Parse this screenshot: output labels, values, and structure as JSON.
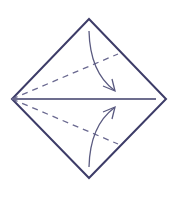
{
  "diagram": {
    "type": "origami-fold-instruction",
    "colors": {
      "line": "#3d3c68",
      "dashed": "#6a6990",
      "arrow": "#5a5a80",
      "background": "#ffffff"
    },
    "shape": {
      "top": [
        89,
        19
      ],
      "right": [
        166,
        99
      ],
      "bottom": [
        89,
        178
      ],
      "left": [
        12,
        99
      ]
    },
    "center_crease": {
      "from": [
        12,
        99
      ],
      "to": [
        156,
        99
      ]
    },
    "dashed_folds": [
      {
        "from": [
          12,
          99
        ],
        "to": [
          118,
          54
        ]
      },
      {
        "from": [
          12,
          99
        ],
        "to": [
          118,
          144
        ]
      }
    ],
    "arrows": [
      {
        "name": "fold-down-arrow",
        "start": [
          89,
          31
        ],
        "control": [
          90,
          70
        ],
        "end": [
          115,
          91
        ]
      },
      {
        "name": "fold-up-arrow",
        "start": [
          89,
          167
        ],
        "control": [
          90,
          128
        ],
        "end": [
          115,
          107
        ]
      }
    ]
  }
}
